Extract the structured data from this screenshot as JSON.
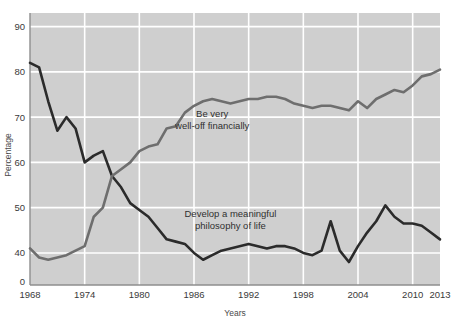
{
  "chart_data": {
    "type": "line",
    "title": "",
    "xlabel": "Years",
    "ylabel": "Percentage",
    "xlim": [
      1968,
      2013
    ],
    "ylim": [
      35,
      93
    ],
    "yticks": [
      0,
      40,
      50,
      60,
      70,
      80,
      90
    ],
    "ytick_labels": [
      "0",
      "40",
      "50",
      "60",
      "70",
      "80",
      "90"
    ],
    "xticks": [
      1968,
      1974,
      1980,
      1986,
      1992,
      1998,
      2004,
      2010,
      2013
    ],
    "xtick_labels": [
      "1968",
      "1974",
      "1980",
      "1986",
      "1992",
      "1998",
      "2004",
      "2010",
      "2013"
    ],
    "grid": true,
    "grid_color": "#ffffff",
    "plot_bg": "#cfcfcf",
    "legend_position": "inline-annotations",
    "axis_note": "y-axis is broken between 0 and 40",
    "series": [
      {
        "name": "Develop a meaningful philosophy of life",
        "color": "#2b2b2b",
        "annotation": [
          "Develop a meaningful",
          "philosophy of life"
        ],
        "annotation_x": 1990,
        "annotation_y": 48,
        "x": [
          1968,
          1969,
          1970,
          1971,
          1972,
          1973,
          1974,
          1975,
          1976,
          1977,
          1978,
          1979,
          1980,
          1981,
          1982,
          1983,
          1984,
          1985,
          1986,
          1987,
          1988,
          1989,
          1990,
          1991,
          1992,
          1993,
          1994,
          1995,
          1996,
          1997,
          1998,
          1999,
          2000,
          2001,
          2002,
          2003,
          2004,
          2005,
          2006,
          2007,
          2008,
          2009,
          2010,
          2011,
          2012,
          2013
        ],
        "y": [
          82.0,
          81.0,
          73.5,
          67.0,
          70.0,
          67.5,
          60.0,
          61.5,
          62.5,
          57.0,
          54.5,
          51.0,
          49.5,
          48.0,
          45.5,
          43.0,
          42.5,
          42.0,
          40.0,
          38.5,
          39.5,
          40.5,
          41.0,
          41.5,
          42.0,
          41.5,
          41.0,
          41.5,
          41.5,
          41.0,
          40.0,
          39.5,
          40.5,
          47.0,
          40.5,
          38.0,
          41.5,
          44.5,
          47.0,
          50.5,
          48.0,
          46.5,
          46.5,
          46.0,
          44.5,
          43.0
        ]
      },
      {
        "name": "Be very well-off financially",
        "color": "#6e6e6e",
        "annotation": [
          "Be very",
          "well-off financially"
        ],
        "annotation_x": 1988,
        "annotation_y": 70,
        "x": [
          1968,
          1969,
          1970,
          1971,
          1972,
          1973,
          1974,
          1975,
          1976,
          1977,
          1978,
          1979,
          1980,
          1981,
          1982,
          1983,
          1984,
          1985,
          1986,
          1987,
          1988,
          1989,
          1990,
          1991,
          1992,
          1993,
          1994,
          1995,
          1996,
          1997,
          1998,
          1999,
          2000,
          2001,
          2002,
          2003,
          2004,
          2005,
          2006,
          2007,
          2008,
          2009,
          2010,
          2011,
          2012,
          2013
        ],
        "y": [
          41.0,
          39.0,
          38.5,
          39.0,
          39.5,
          40.5,
          41.5,
          48.0,
          50.0,
          57.0,
          58.5,
          60.0,
          62.5,
          63.5,
          64.0,
          67.5,
          68.0,
          71.0,
          72.5,
          73.5,
          74.0,
          73.5,
          73.0,
          73.5,
          74.0,
          74.0,
          74.5,
          74.5,
          74.0,
          73.0,
          72.5,
          72.0,
          72.5,
          72.5,
          72.0,
          71.5,
          73.5,
          72.0,
          74.0,
          75.0,
          76.0,
          75.5,
          77.0,
          79.0,
          79.5,
          80.5
        ]
      }
    ]
  },
  "axes": {
    "ylabel": "Percentage",
    "xlabel": "Years"
  }
}
